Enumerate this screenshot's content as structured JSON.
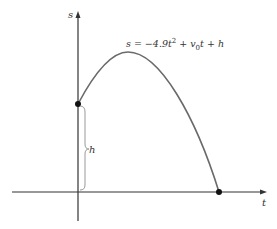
{
  "diagram": {
    "axes": {
      "x_label": "t",
      "y_label": "s"
    },
    "curve": {
      "equation_prefix": "s = −4.9t",
      "equation_exp": "2",
      "equation_mid": " + v",
      "equation_sub": "0",
      "equation_suffix": "t + h"
    },
    "height_label": "h",
    "colors": {
      "curve": "#6a6a6a",
      "axis": "#333333",
      "point": "#111111",
      "brace": "#999999"
    }
  }
}
